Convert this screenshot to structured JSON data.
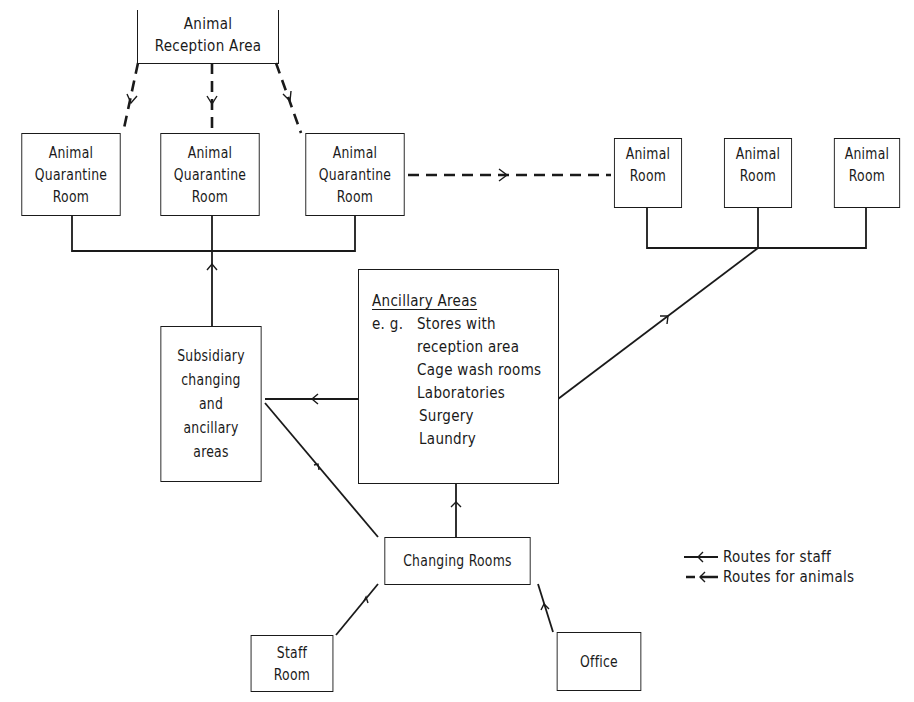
{
  "diagram": {
    "type": "flow-diagram",
    "nodes": {
      "reception": {
        "lines": [
          "Animal",
          "Reception Area"
        ]
      },
      "quarantine_1": {
        "lines": [
          "Animal",
          "Quarantine",
          "Room"
        ]
      },
      "quarantine_2": {
        "lines": [
          "Animal",
          "Quarantine",
          "Room"
        ]
      },
      "quarantine_3": {
        "lines": [
          "Animal",
          "Quarantine",
          "Room"
        ]
      },
      "animal_room_1": {
        "lines": [
          "Animal",
          "Room"
        ]
      },
      "animal_room_2": {
        "lines": [
          "Animal",
          "Room"
        ]
      },
      "animal_room_3": {
        "lines": [
          "Animal",
          "Room"
        ]
      },
      "subsidiary": {
        "lines": [
          "Subsidiary",
          "changing",
          "and",
          "ancillary",
          "areas"
        ]
      },
      "ancillary": {
        "title": "Ancillary Areas",
        "eg_label": "e. g.",
        "items": [
          "Stores with",
          "reception area",
          "Cage wash rooms",
          "Laboratories",
          "Surgery",
          "Laundry"
        ]
      },
      "changing_rooms": {
        "lines": [
          "Changing Rooms"
        ]
      },
      "staff_room": {
        "lines": [
          "Staff",
          "Room"
        ]
      },
      "office": {
        "lines": [
          "Office"
        ]
      }
    },
    "edges": [
      {
        "from": "reception",
        "to": "quarantine_1",
        "route": "animals"
      },
      {
        "from": "reception",
        "to": "quarantine_2",
        "route": "animals"
      },
      {
        "from": "reception",
        "to": "quarantine_3",
        "route": "animals"
      },
      {
        "from": "quarantine_3",
        "to": "animal_room_1",
        "route": "animals"
      },
      {
        "from": "subsidiary",
        "to": "quarantine_rooms",
        "route": "staff"
      },
      {
        "from": "ancillary",
        "to": "subsidiary",
        "route": "staff"
      },
      {
        "from": "changing_rooms",
        "to": "subsidiary",
        "route": "staff"
      },
      {
        "from": "changing_rooms",
        "to": "ancillary",
        "route": "staff"
      },
      {
        "from": "ancillary",
        "to": "animal_rooms",
        "route": "staff"
      },
      {
        "from": "staff_room",
        "to": "changing_rooms",
        "route": "staff"
      },
      {
        "from": "office",
        "to": "changing_rooms",
        "route": "staff"
      }
    ],
    "legend": {
      "staff": "Routes for staff",
      "animals": "Routes for animals"
    },
    "colors": {
      "ink": "#1a1a1a",
      "background": "#ffffff"
    }
  }
}
